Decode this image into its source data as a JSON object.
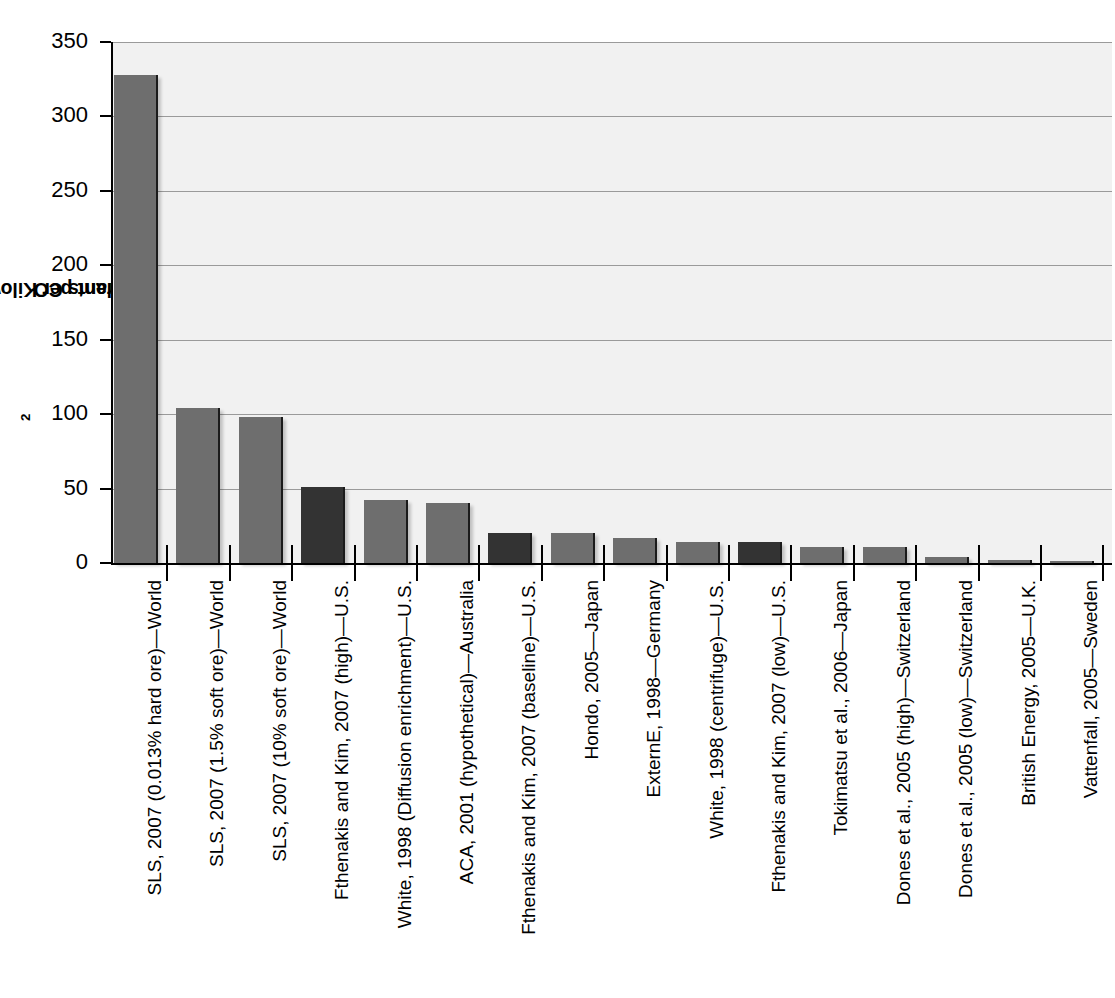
{
  "chart_data": {
    "type": "bar",
    "title": "",
    "xlabel": "",
    "ylabel": "Grams CO2 Equivalent per Kilowatt-hour",
    "ylabel_prefix": "Grams CO",
    "ylabel_sub": "2",
    "ylabel_suffix": " Equivalent per Kilowatt-hour",
    "ylim": [
      0,
      350
    ],
    "yticks": [
      0,
      50,
      100,
      150,
      200,
      250,
      300,
      350
    ],
    "ytick_labels": [
      "0",
      "50",
      "100",
      "150",
      "200",
      "250",
      "300",
      "350"
    ],
    "grid": true,
    "grid_axis": "y",
    "legend": "none",
    "categories": [
      "SLS, 2007 (0.013% hard ore)—World",
      "SLS, 2007 (1.5% soft ore)—World",
      "SLS, 2007 (10% soft ore)—World",
      "Fthenakis and Kim, 2007 (high)—U.S.",
      "White, 1998 (Diffusion enrichment)—U.S.",
      "ACA, 2001 (hypothetical)—Australia",
      "Fthenakis and Kim, 2007 (baseline)—U.S.",
      "Hondo, 2005—Japan",
      "ExternE, 1998—Germany",
      "White, 1998 (centrifuge)—U.S.",
      "Fthenakis and Kim, 2007 (low)—U.S.",
      "Tokimatsu et al., 2006—Japan",
      "Dones et al., 2005 (high)—Switzerland",
      "Dones et al., 2005 (low)—Switzerland",
      "British Energy, 2005—U.K.",
      "Vattenfall, 2005—Sweden"
    ],
    "values": [
      328,
      104,
      98,
      51,
      42,
      40,
      20,
      20,
      17,
      14,
      14,
      11,
      11,
      4,
      2,
      1
    ],
    "bar_colors": [
      "#6e6e6e",
      "#6e6e6e",
      "#6e6e6e",
      "#333333",
      "#6e6e6e",
      "#6e6e6e",
      "#333333",
      "#6e6e6e",
      "#6e6e6e",
      "#6e6e6e",
      "#333333",
      "#6e6e6e",
      "#6e6e6e",
      "#6e6e6e",
      "#6e6e6e",
      "#6e6e6e"
    ]
  },
  "style": {
    "plot_background": "#f1f1f1",
    "gridline_color": "#9a9a9a",
    "axis_color": "#000000",
    "bar_gray": "#6e6e6e",
    "bar_dark": "#333333"
  }
}
